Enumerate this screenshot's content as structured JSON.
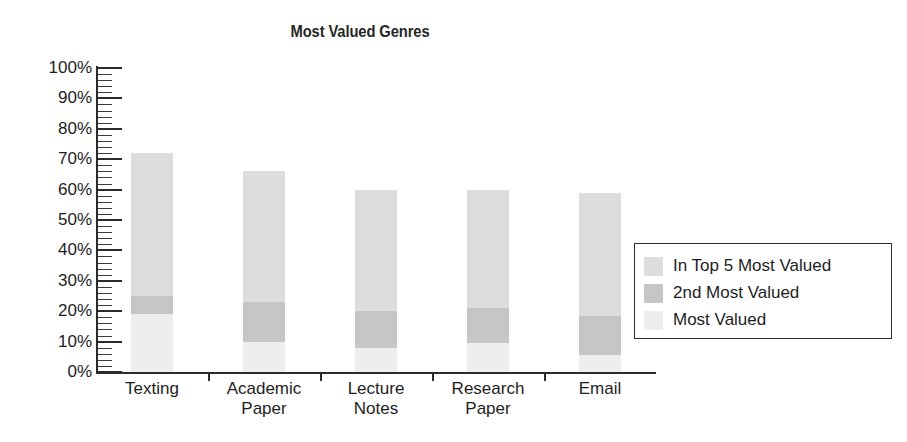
{
  "chart_data": {
    "type": "bar",
    "subtype": "stacked-bar",
    "title": "Most Valued Genres",
    "subtitle": "",
    "xlabel": "",
    "ylabel": "",
    "ylim": [
      0,
      100
    ],
    "yunit": "%",
    "ytick_labels": [
      "0%",
      "10%",
      "20%",
      "30%",
      "40%",
      "50%",
      "60%",
      "70%",
      "80%",
      "90%",
      "100%"
    ],
    "ytick_values": [
      0,
      10,
      20,
      30,
      40,
      50,
      60,
      70,
      80,
      90,
      100
    ],
    "minor_tick_step": 2,
    "grid": false,
    "legend_position": "right-inside",
    "categories": [
      "Texting",
      "Academic Paper",
      "Lecture Notes",
      "Research Paper",
      "Email"
    ],
    "category_lines": [
      [
        "Texting"
      ],
      [
        "Academic",
        "Paper"
      ],
      [
        "Lecture",
        "Notes"
      ],
      [
        "Research",
        "Paper"
      ],
      [
        "Email"
      ]
    ],
    "series": [
      {
        "name": "Most Valued",
        "color": "#eeeeee",
        "values": [
          19,
          10,
          8,
          9.5,
          5.5
        ]
      },
      {
        "name": "2nd Most Valued",
        "color": "#c6c6c6",
        "values": [
          6,
          13,
          12,
          11.5,
          13
        ]
      },
      {
        "name": "In Top 5 Most Valued",
        "color": "#dddddd",
        "values": [
          47,
          43,
          40,
          39,
          40.5
        ]
      }
    ],
    "stack_tops": [
      {
        "category": "Texting",
        "most_valued": 19,
        "second_most_valued": 25,
        "in_top_5": 72
      },
      {
        "category": "Academic Paper",
        "most_valued": 10,
        "second_most_valued": 23,
        "in_top_5": 66
      },
      {
        "category": "Lecture Notes",
        "most_valued": 8,
        "second_most_valued": 20,
        "in_top_5": 60
      },
      {
        "category": "Research Paper",
        "most_valued": 9.5,
        "second_most_valued": 21,
        "in_top_5": 60
      },
      {
        "category": "Email",
        "most_valued": 5.5,
        "second_most_valued": 18.5,
        "in_top_5": 59
      }
    ]
  },
  "legend": {
    "items": [
      {
        "label": "In Top 5 Most Valued",
        "color": "#dddddd"
      },
      {
        "label": "2nd Most Valued",
        "color": "#c6c6c6"
      },
      {
        "label": "Most Valued",
        "color": "#eeeeee"
      }
    ]
  },
  "axis": {
    "y_labels": [
      "100%",
      "90%",
      "80%",
      "70%",
      "60%",
      "50%",
      "40%",
      "30%",
      "20%",
      "10%",
      "0%"
    ],
    "x_labels": [
      "Texting",
      "Academic Paper",
      "Lecture Notes",
      "Research Paper",
      "Email"
    ]
  },
  "colors": {
    "axis": "#2b2b2b",
    "text": "#1e1e1e",
    "background": "#ffffff"
  }
}
